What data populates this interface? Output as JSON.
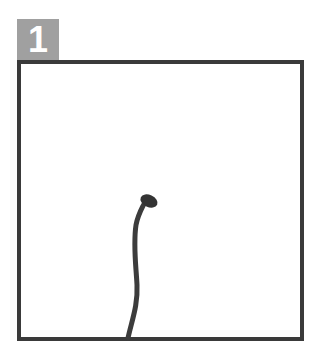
{
  "panel": {
    "number": "1",
    "badge_color": "#a0a0a0",
    "border_color": "#3a3a3a",
    "stroke_color": "#3c3c3c"
  },
  "drawing": {
    "description": "single hand-drawn curved stroke rising from bottom edge ending in a small blob",
    "path": "M128 338 C132 320, 138 305, 137 285 C136 265, 133 245, 136 225 C138 215, 141 210, 144 204"
  }
}
